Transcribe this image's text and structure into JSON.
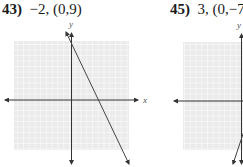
{
  "problems": [
    {
      "number": "43)",
      "params": "−2, (0,9)",
      "slope": -2,
      "y_intercept": [
        0,
        9
      ],
      "axis_labels": {
        "x": "x",
        "y": "y"
      }
    },
    {
      "number": "45)",
      "params": "3, (0,−7)",
      "slope": 3,
      "y_intercept": [
        0,
        -7
      ],
      "axis_labels": {
        "x": "x",
        "y": "y"
      }
    }
  ],
  "colors": {
    "grid_bg": "#ededed",
    "grid_line": "#ffffff",
    "axis": "#333333",
    "line": "#444444",
    "text": "#1a1a1a"
  }
}
